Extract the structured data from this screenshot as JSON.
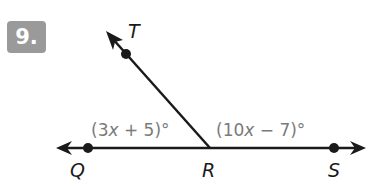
{
  "problem": {
    "number_label": "9."
  },
  "diagram": {
    "points": {
      "Q": {
        "label": "Q"
      },
      "R": {
        "label": "R"
      },
      "S": {
        "label": "S"
      },
      "T": {
        "label": "T"
      }
    },
    "angles": {
      "QRT": {
        "prefix": "(3",
        "var": "x",
        "suffix": " + 5)°"
      },
      "TRS": {
        "prefix": "(10",
        "var": "x",
        "suffix": " − 7)°"
      }
    },
    "colors": {
      "line": "#1a1a1a",
      "angle_text": "#7a7a7a",
      "badge_bg": "#9a9a9a",
      "badge_text": "#ffffff"
    }
  }
}
